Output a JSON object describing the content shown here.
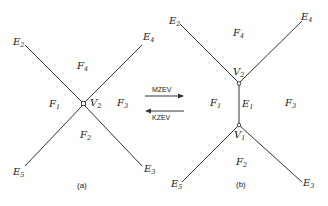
{
  "diagram_a": {
    "caption": "(a)",
    "vertex": {
      "name": "V",
      "sub": "2"
    },
    "edges": [
      {
        "name": "E",
        "sub": "2"
      },
      {
        "name": "E",
        "sub": "4"
      },
      {
        "name": "E",
        "sub": "5"
      },
      {
        "name": "E",
        "sub": "3"
      }
    ],
    "faces": [
      {
        "name": "F",
        "sub": "4"
      },
      {
        "name": "F",
        "sub": "1"
      },
      {
        "name": "F",
        "sub": "3"
      },
      {
        "name": "F",
        "sub": "2"
      }
    ]
  },
  "operators": {
    "forward": "MZEV",
    "backward": "KZEV"
  },
  "diagram_b": {
    "caption": "(b)",
    "vertices": [
      {
        "name": "V",
        "sub": "2"
      },
      {
        "name": "V",
        "sub": "1"
      }
    ],
    "edges": [
      {
        "name": "E",
        "sub": "2"
      },
      {
        "name": "E",
        "sub": "4"
      },
      {
        "name": "E",
        "sub": "1"
      },
      {
        "name": "E",
        "sub": "5"
      },
      {
        "name": "E",
        "sub": "3"
      }
    ],
    "faces": [
      {
        "name": "F",
        "sub": "4"
      },
      {
        "name": "F",
        "sub": "1"
      },
      {
        "name": "F",
        "sub": "3"
      },
      {
        "name": "F",
        "sub": "2"
      }
    ]
  }
}
